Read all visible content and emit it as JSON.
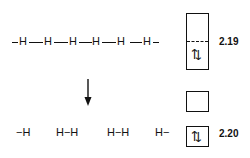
{
  "top_chain": {
    "lead_bond": "−",
    "atoms": [
      "H",
      "H",
      "H",
      "H",
      "H",
      "H"
    ],
    "trail_bond": "−"
  },
  "arrow": {
    "direction": "down",
    "icon": "arrow-down-icon"
  },
  "bottom_fragments": [
    "−H",
    "H−H",
    "H−H",
    "H−"
  ],
  "band_diagrams": [
    {
      "label": "2.19",
      "type": "single-band-half-filled",
      "spins": "⇅"
    },
    {
      "label": "2.20",
      "type": "split-bands",
      "spins": "⇅"
    }
  ]
}
